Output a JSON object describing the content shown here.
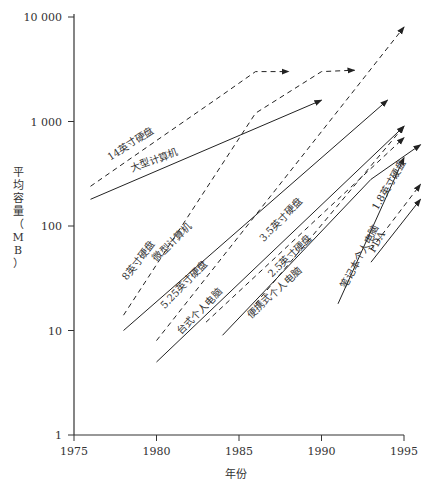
{
  "chart_data": {
    "type": "line",
    "title": "",
    "xlabel": "年份",
    "ylabel": "平均容量（MB）",
    "yscale": "log",
    "xlim": [
      1975,
      1995
    ],
    "ylim": [
      1,
      10000
    ],
    "xticks": [
      "1975",
      "1980",
      "1985",
      "1990",
      "1995"
    ],
    "yticks": [
      "1",
      "10",
      "100",
      "1 000",
      "10 000"
    ],
    "grid": false,
    "legend": "inline labels along lines",
    "series": [
      {
        "name": "14英寸硬盘",
        "style": "dashed",
        "points": [
          [
            1976,
            240
          ],
          [
            1984,
            1800
          ],
          [
            1986,
            3000
          ],
          [
            1988,
            3000
          ]
        ]
      },
      {
        "name": "大型计算机",
        "style": "solid",
        "points": [
          [
            1976,
            180
          ],
          [
            1990,
            1600
          ]
        ]
      },
      {
        "name": "8英寸硬盘",
        "style": "dashed",
        "points": [
          [
            1978,
            14
          ],
          [
            1986,
            1200
          ],
          [
            1990,
            3000
          ],
          [
            1992,
            3100
          ]
        ]
      },
      {
        "name": "微型计算机",
        "style": "solid",
        "points": [
          [
            1978,
            10
          ],
          [
            1994,
            1600
          ]
        ]
      },
      {
        "name": "5.25英寸硬盘",
        "style": "dashed",
        "points": [
          [
            1980,
            8
          ],
          [
            1995,
            8000
          ]
        ]
      },
      {
        "name": "台式个人电脑",
        "style": "solid",
        "points": [
          [
            1980,
            5
          ],
          [
            1995,
            900
          ]
        ]
      },
      {
        "name": "3.5英寸硬盘",
        "style": "dashed",
        "points": [
          [
            1983,
            12
          ],
          [
            1995,
            700
          ]
        ]
      },
      {
        "name": "2.5英寸硬盘",
        "style": "dashed",
        "points": [
          [
            1986,
            18
          ],
          [
            1995,
            900
          ]
        ]
      },
      {
        "name": "便携式个人电脑",
        "style": "solid",
        "points": [
          [
            1984,
            9
          ],
          [
            1993,
            280
          ],
          [
            1996,
            600
          ]
        ]
      },
      {
        "name": "笔记本个人电脑",
        "style": "solid",
        "points": [
          [
            1991,
            18
          ],
          [
            1995,
            450
          ]
        ]
      },
      {
        "name": "1.8英寸硬盘",
        "style": "dashed",
        "points": [
          [
            1993,
            60
          ],
          [
            1996,
            250
          ]
        ]
      },
      {
        "name": "PDA",
        "style": "solid",
        "points": [
          [
            1993,
            45
          ],
          [
            1996,
            180
          ]
        ]
      }
    ]
  },
  "labels": {
    "x_title": "年份",
    "y_title": "平均容量（MB）"
  }
}
